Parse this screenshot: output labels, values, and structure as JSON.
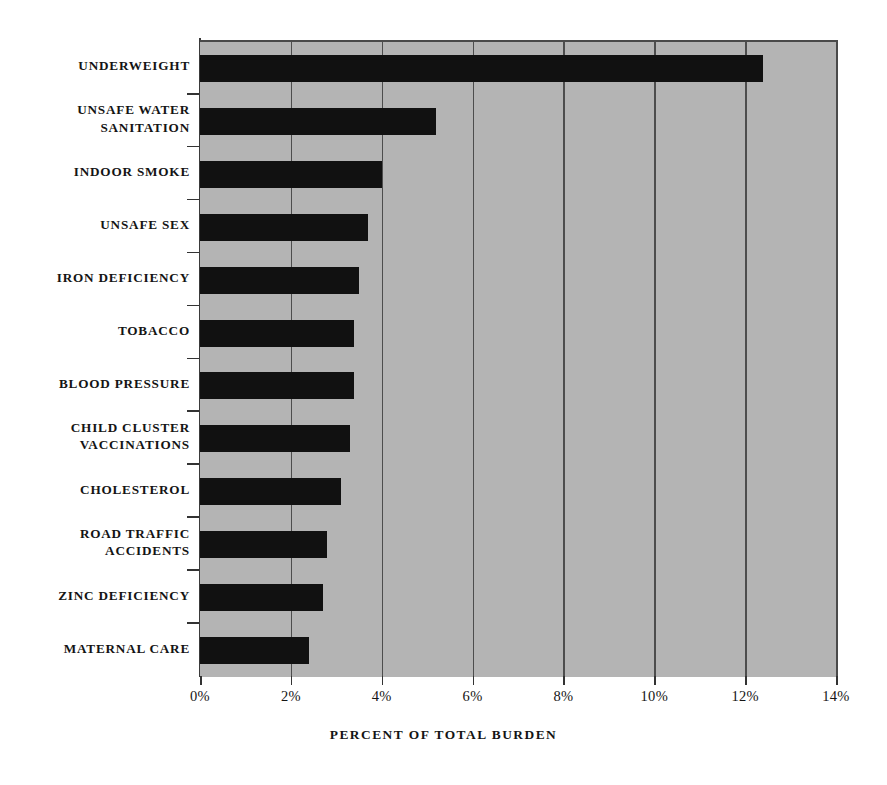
{
  "chart_data": {
    "type": "bar",
    "orientation": "horizontal",
    "title": "",
    "xlabel": "PERCENT OF TOTAL BURDEN",
    "ylabel": "",
    "xlim": [
      0,
      14
    ],
    "xticks": [
      0,
      2,
      4,
      6,
      8,
      10,
      12,
      14
    ],
    "xticklabels": [
      "0%",
      "2%",
      "4%",
      "6%",
      "8%",
      "10%",
      "12%",
      "14%"
    ],
    "grid": "vertical",
    "legend": "none",
    "bar_color": "#111111",
    "plot_background": "#b4b4b4",
    "categories": [
      "UNDERWEIGHT",
      "UNSAFE  WATER SANITATION",
      "INDOOR SMOKE",
      "UNSAFE SEX",
      "IRON DEFICIENCY",
      "TOBACCO",
      "BLOOD PRESSURE",
      "CHILD CLUSTER VACCINATIONS",
      "CHOLESTEROL",
      "ROAD TRAFFIC ACCIDENTS",
      "ZINC DEFICIENCY",
      "MATERNAL CARE"
    ],
    "values": [
      12.4,
      5.2,
      4.0,
      3.7,
      3.5,
      3.4,
      3.4,
      3.3,
      3.1,
      2.8,
      2.7,
      2.4
    ],
    "units": "percent"
  },
  "axis": {
    "x_title": "PERCENT OF TOTAL BURDEN",
    "tick_labels": [
      "0%",
      "2%",
      "4%",
      "6%",
      "8%",
      "10%",
      "12%",
      "14%"
    ]
  },
  "category_labels": [
    {
      "lines": [
        "UNDERWEIGHT"
      ]
    },
    {
      "lines": [
        "UNSAFE  WATER",
        "SANITATION"
      ]
    },
    {
      "lines": [
        "INDOOR SMOKE"
      ]
    },
    {
      "lines": [
        "UNSAFE SEX"
      ]
    },
    {
      "lines": [
        "IRON DEFICIENCY"
      ]
    },
    {
      "lines": [
        "TOBACCO"
      ]
    },
    {
      "lines": [
        "BLOOD PRESSURE"
      ]
    },
    {
      "lines": [
        "CHILD CLUSTER",
        "VACCINATIONS"
      ]
    },
    {
      "lines": [
        "CHOLESTEROL"
      ]
    },
    {
      "lines": [
        "ROAD TRAFFIC",
        "ACCIDENTS"
      ]
    },
    {
      "lines": [
        "ZINC DEFICIENCY"
      ]
    },
    {
      "lines": [
        "MATERNAL CARE"
      ]
    }
  ]
}
